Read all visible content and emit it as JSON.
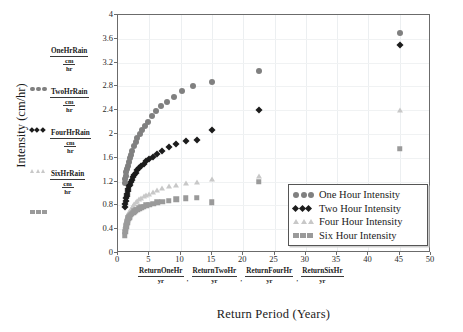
{
  "axes": {
    "x_title": "Return Period (Years)",
    "y_title": "Intensity (cm/hr)",
    "xticks": [
      "0",
      "5",
      "10",
      "15",
      "20",
      "25",
      "30",
      "35",
      "40",
      "45",
      "50"
    ],
    "yticks": [
      "0",
      "0.4",
      "0.8",
      "1.2",
      "1.6",
      "2",
      "2.4",
      "2.8",
      "3.2",
      "3.6",
      "4"
    ]
  },
  "left_labels": [
    {
      "num": "OneHrRain",
      "u1": "cm",
      "u2": "hr",
      "marker": "circle",
      "color": "#808080"
    },
    {
      "num": "TwoHrRain",
      "u1": "cm",
      "u2": "hr",
      "marker": "diamond",
      "color": "#1c1c1c"
    },
    {
      "num": "FourHrRain",
      "u1": "cm",
      "u2": "hr",
      "marker": "triangle",
      "color": "#c8c8c8"
    },
    {
      "num": "SixHrRain",
      "u1": "cm",
      "u2": "hr",
      "marker": "square",
      "color": "#9a9a9a"
    }
  ],
  "bottom_labels": [
    {
      "num": "ReturnOneHr",
      "den": "yr",
      "sep": ","
    },
    {
      "num": "ReturnTwoHr",
      "den": "yr",
      "sep": ","
    },
    {
      "num": "ReturnFourHr",
      "den": "yr",
      "sep": ","
    },
    {
      "num": "ReturnSixHr",
      "den": "yr",
      "sep": ""
    }
  ],
  "legend": {
    "items": [
      {
        "label": "One Hour Intensity",
        "marker": "circle",
        "color": "#808080"
      },
      {
        "label": "Two Hour Intensity",
        "marker": "diamond",
        "color": "#1c1c1c"
      },
      {
        "label": "Four Hour Intensity",
        "marker": "triangle",
        "color": "#c8c8c8"
      },
      {
        "label": "Six Hour Intensity",
        "marker": "square",
        "color": "#9a9a9a"
      }
    ]
  },
  "chart_data": {
    "type": "scatter",
    "title": "",
    "xlabel": "Return Period (Years)",
    "ylabel": "Intensity (cm/hr)",
    "xlim": [
      0,
      50
    ],
    "ylim": [
      0,
      4
    ],
    "xtick_step": 5,
    "ytick_step": 0.4,
    "grid": true,
    "legend_position": "right-inside",
    "series": [
      {
        "name": "One Hour Intensity",
        "marker": "circle",
        "color": "#808080",
        "points": [
          [
            1.05,
            1.18
          ],
          [
            1.15,
            1.24
          ],
          [
            1.25,
            1.3
          ],
          [
            1.35,
            1.36
          ],
          [
            1.45,
            1.41
          ],
          [
            1.6,
            1.47
          ],
          [
            1.75,
            1.53
          ],
          [
            1.9,
            1.59
          ],
          [
            2.1,
            1.65
          ],
          [
            2.3,
            1.72
          ],
          [
            2.55,
            1.79
          ],
          [
            2.8,
            1.86
          ],
          [
            3.1,
            1.93
          ],
          [
            3.45,
            2.0
          ],
          [
            3.8,
            2.07
          ],
          [
            4.3,
            2.14
          ],
          [
            4.8,
            2.21
          ],
          [
            5.4,
            2.3
          ],
          [
            6.1,
            2.39
          ],
          [
            6.9,
            2.47
          ],
          [
            7.8,
            2.53
          ],
          [
            8.9,
            2.62
          ],
          [
            10.2,
            2.72
          ],
          [
            12.0,
            2.81
          ],
          [
            15.0,
            2.88
          ],
          [
            22.5,
            3.06
          ],
          [
            45.0,
            3.7
          ]
        ]
      },
      {
        "name": "Two Hour Intensity",
        "marker": "diamond",
        "color": "#1c1c1c",
        "points": [
          [
            1.05,
            0.78
          ],
          [
            1.12,
            0.83
          ],
          [
            1.2,
            0.88
          ],
          [
            1.28,
            0.92
          ],
          [
            1.36,
            0.96
          ],
          [
            1.45,
            1.0
          ],
          [
            1.55,
            1.04
          ],
          [
            1.66,
            1.08
          ],
          [
            1.78,
            1.12
          ],
          [
            1.9,
            1.15
          ],
          [
            2.05,
            1.19
          ],
          [
            2.2,
            1.23
          ],
          [
            2.4,
            1.27
          ],
          [
            2.6,
            1.31
          ],
          [
            2.85,
            1.35
          ],
          [
            3.1,
            1.39
          ],
          [
            3.4,
            1.43
          ],
          [
            3.75,
            1.47
          ],
          [
            4.1,
            1.5
          ],
          [
            4.5,
            1.54
          ],
          [
            5.0,
            1.58
          ],
          [
            5.6,
            1.62
          ],
          [
            6.3,
            1.67
          ],
          [
            7.1,
            1.72
          ],
          [
            8.1,
            1.78
          ],
          [
            9.3,
            1.83
          ],
          [
            10.8,
            1.88
          ],
          [
            12.6,
            1.9
          ],
          [
            15.0,
            2.07
          ],
          [
            22.5,
            2.4
          ],
          [
            45.0,
            3.5
          ]
        ]
      },
      {
        "name": "Four Hour Intensity",
        "marker": "triangle",
        "color": "#c8c8c8",
        "points": [
          [
            1.05,
            0.42
          ],
          [
            1.12,
            0.46
          ],
          [
            1.2,
            0.5
          ],
          [
            1.28,
            0.54
          ],
          [
            1.36,
            0.57
          ],
          [
            1.45,
            0.6
          ],
          [
            1.55,
            0.63
          ],
          [
            1.66,
            0.66
          ],
          [
            1.78,
            0.69
          ],
          [
            1.9,
            0.71
          ],
          [
            2.05,
            0.74
          ],
          [
            2.2,
            0.76
          ],
          [
            2.4,
            0.79
          ],
          [
            2.6,
            0.82
          ],
          [
            2.85,
            0.85
          ],
          [
            3.1,
            0.87
          ],
          [
            3.4,
            0.9
          ],
          [
            3.75,
            0.93
          ],
          [
            4.1,
            0.95
          ],
          [
            4.5,
            0.98
          ],
          [
            5.0,
            1.0
          ],
          [
            5.6,
            1.03
          ],
          [
            6.3,
            1.06
          ],
          [
            7.1,
            1.09
          ],
          [
            8.1,
            1.12
          ],
          [
            9.3,
            1.15
          ],
          [
            10.8,
            1.18
          ],
          [
            12.6,
            1.2
          ],
          [
            15.0,
            1.25
          ],
          [
            22.5,
            1.3
          ],
          [
            45.0,
            2.4
          ]
        ]
      },
      {
        "name": "Six Hour Intensity",
        "marker": "square",
        "color": "#9a9a9a",
        "points": [
          [
            1.05,
            0.3
          ],
          [
            1.12,
            0.36
          ],
          [
            1.2,
            0.41
          ],
          [
            1.28,
            0.45
          ],
          [
            1.36,
            0.49
          ],
          [
            1.45,
            0.52
          ],
          [
            1.55,
            0.55
          ],
          [
            1.66,
            0.58
          ],
          [
            1.78,
            0.6
          ],
          [
            1.9,
            0.62
          ],
          [
            2.05,
            0.64
          ],
          [
            2.2,
            0.66
          ],
          [
            2.4,
            0.68
          ],
          [
            2.6,
            0.7
          ],
          [
            2.85,
            0.72
          ],
          [
            3.1,
            0.73
          ],
          [
            3.4,
            0.75
          ],
          [
            3.75,
            0.77
          ],
          [
            4.1,
            0.78
          ],
          [
            4.5,
            0.8
          ],
          [
            5.0,
            0.81
          ],
          [
            5.6,
            0.83
          ],
          [
            6.3,
            0.85
          ],
          [
            7.1,
            0.86
          ],
          [
            8.1,
            0.88
          ],
          [
            9.3,
            0.9
          ],
          [
            10.8,
            0.92
          ],
          [
            12.6,
            0.93
          ],
          [
            15.0,
            0.85
          ],
          [
            22.5,
            1.2
          ],
          [
            45.0,
            1.75
          ]
        ]
      }
    ]
  }
}
